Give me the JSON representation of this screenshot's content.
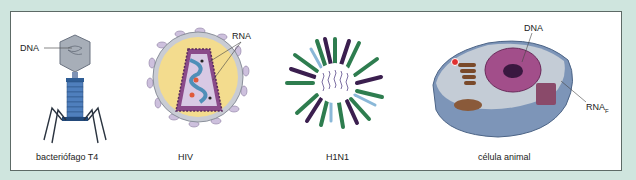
{
  "figure": {
    "panels": [
      {
        "id": "t4",
        "caption": "bacteriófago T4",
        "labels": [
          "DNA"
        ]
      },
      {
        "id": "hiv",
        "caption": "HIV",
        "labels": [
          "RNA"
        ]
      },
      {
        "id": "h1n1",
        "caption": "H1N1",
        "labels": []
      },
      {
        "id": "cell",
        "caption": "célula animal",
        "labels": [
          "DNA",
          "RNA",
          "F"
        ]
      }
    ],
    "colors": {
      "background": "#cfe5de",
      "panel": "#ffffff",
      "border": "#5d6a66",
      "h1n1_green": "#2e7d4f",
      "h1n1_purple": "#3b1f4f",
      "h1n1_blue": "#8ab8d8",
      "hiv_envelope": "#f3dc8e",
      "hiv_capsid": "#7a3e7a",
      "t4_blue": "#3f6fa8"
    }
  }
}
